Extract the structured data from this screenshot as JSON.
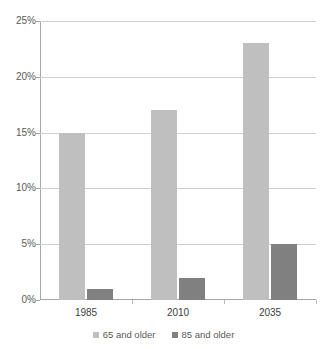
{
  "chart_data": {
    "type": "bar",
    "title": "",
    "subtitle": "",
    "xlabel": "",
    "ylabel": "",
    "categories": [
      "1985",
      "2010",
      "2035"
    ],
    "series": [
      {
        "name": "65 and older",
        "color": "#bfbfbf",
        "values": [
          15,
          17,
          23
        ]
      },
      {
        "name": "85 and older",
        "color": "#808080",
        "values": [
          1,
          2,
          5
        ]
      }
    ],
    "ylim": [
      0,
      25
    ],
    "ytick_values": [
      0,
      5,
      10,
      15,
      20,
      25
    ],
    "ytick_labels": [
      "0%",
      "5%",
      "10%",
      "15%",
      "20%",
      "25%"
    ],
    "grid": true,
    "legend_position": "bottom",
    "value_suffix": "%"
  },
  "colors": {
    "background": "#ffffff",
    "axis": "#a6a6a6",
    "gridline": "#d0d0d0",
    "tick_text": "#595959",
    "category_text": "#404040",
    "series_65": "#bfbfbf",
    "series_85": "#808080"
  }
}
